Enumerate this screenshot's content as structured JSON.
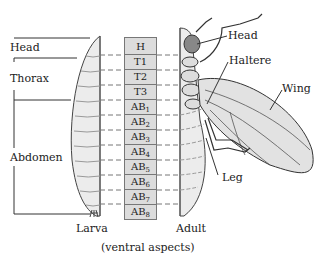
{
  "figure": {
    "caption": "(ventral aspects)",
    "larva_label": "Larva",
    "adult_label": "Adult"
  },
  "left_brackets": [
    {
      "label": "Head"
    },
    {
      "label": "Thorax"
    },
    {
      "label": "Abdomen"
    }
  ],
  "segments": [
    {
      "label": "H",
      "sub": ""
    },
    {
      "label": "T1",
      "sub": ""
    },
    {
      "label": "T2",
      "sub": ""
    },
    {
      "label": "T3",
      "sub": ""
    },
    {
      "label": "AB",
      "sub": "1"
    },
    {
      "label": "AB",
      "sub": "2"
    },
    {
      "label": "AB",
      "sub": "3"
    },
    {
      "label": "AB",
      "sub": "4"
    },
    {
      "label": "AB",
      "sub": "5"
    },
    {
      "label": "AB",
      "sub": "6"
    },
    {
      "label": "AB",
      "sub": "7"
    },
    {
      "label": "AB",
      "sub": "8"
    }
  ],
  "adult_callouts": [
    {
      "label": "Head"
    },
    {
      "label": "Haltere"
    },
    {
      "label": "Wing"
    },
    {
      "label": "Leg"
    }
  ],
  "colors": {
    "segment_fill": "#dcdcdc",
    "body_fill": "#ececec",
    "line": "#333333"
  }
}
